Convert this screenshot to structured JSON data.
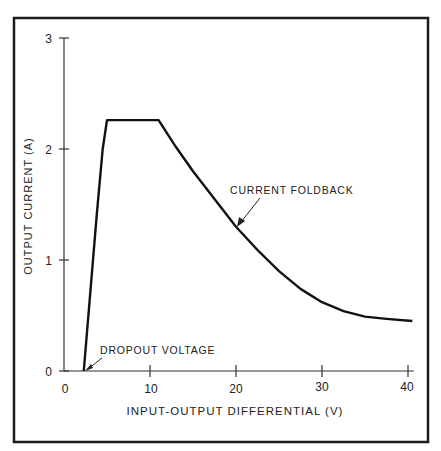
{
  "chart_data": {
    "type": "line",
    "title": "",
    "xlabel": "INPUT-OUTPUT DIFFERENTIAL (V)",
    "ylabel": "OUTPUT CURRENT (A)",
    "xlim": [
      0,
      40
    ],
    "ylim": [
      0,
      3
    ],
    "xticks": [
      0,
      10,
      20,
      30,
      40
    ],
    "yticks": [
      0,
      1,
      2,
      3
    ],
    "xtick_labels": [
      "0",
      "10",
      "20",
      "30",
      "40"
    ],
    "ytick_labels": [
      "0",
      "1",
      "2",
      "3"
    ],
    "grid": false,
    "legend": null,
    "series": [
      {
        "name": "Output current",
        "x": [
          2.3,
          3.0,
          3.8,
          4.5,
          5.0,
          8.0,
          11.0,
          13.0,
          15.0,
          17.5,
          20.0,
          22.5,
          25.0,
          27.5,
          30.0,
          32.5,
          35.0,
          37.5,
          40.5
        ],
        "y": [
          0.0,
          0.6,
          1.4,
          2.0,
          2.26,
          2.26,
          2.26,
          2.02,
          1.8,
          1.55,
          1.3,
          1.09,
          0.9,
          0.74,
          0.62,
          0.54,
          0.49,
          0.47,
          0.45
        ]
      }
    ],
    "annotations": [
      {
        "text": "DROPOUT VOLTAGE",
        "x": 2.3,
        "y": 0.0
      },
      {
        "text": "CURRENT FOLDBACK",
        "x": 20.0,
        "y": 1.3
      }
    ]
  }
}
